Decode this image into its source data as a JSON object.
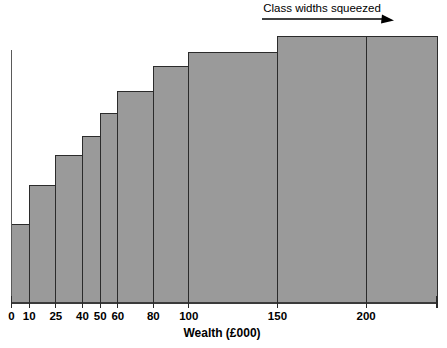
{
  "chart_data": {
    "type": "bar",
    "title": "",
    "subtitle": "",
    "xlabel": "Wealth (£000)",
    "ylabel": "",
    "grid": false,
    "legend": null,
    "xlim": [
      0,
      240
    ],
    "ylim": [
      0,
      1
    ],
    "axis": {
      "x_ticks": [
        0,
        10,
        25,
        40,
        50,
        60,
        80,
        100,
        150,
        200
      ],
      "x_tick_labels": [
        "0",
        "10",
        "25",
        "40",
        "50",
        "60",
        "80",
        "100",
        "150",
        "200"
      ],
      "y_ticks": [],
      "y_tick_labels": []
    },
    "bin_edges": [
      0,
      10,
      25,
      40,
      50,
      60,
      80,
      100,
      150,
      200,
      240
    ],
    "categories": [
      "0–10",
      "10–25",
      "25–40",
      "40–50",
      "50–60",
      "60–80",
      "80–100",
      "100–150",
      "150–200",
      "200+"
    ],
    "values": [
      0.312,
      0.47,
      0.589,
      0.665,
      0.756,
      0.843,
      0.946,
      1.002,
      1.065,
      1.065
    ],
    "annotations": [
      {
        "text": "Class widths squeezed",
        "arrow": "right",
        "x_start": 108,
        "x_end": 180
      }
    ],
    "colors": {
      "bar_fill": "#9a9a9a",
      "bar_edge": "#2b2b2b",
      "axis": "#3a3a3a",
      "text": "#000000",
      "background": "#ffffff"
    }
  }
}
